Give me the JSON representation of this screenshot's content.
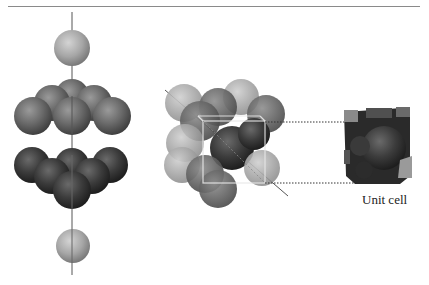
{
  "figure": {
    "caption_unit_cell": "Unit cell",
    "panels": [
      {
        "id": "layered-stack",
        "description": "ABC layer stacking: single sphere, layer of 7, layer of 7, single sphere along vertical axis"
      },
      {
        "id": "cubic-arrangement",
        "description": "Close-packed spheres viewed along body diagonal with cube outline"
      },
      {
        "id": "unit-cell",
        "description": "Face-centered cubic unit cell with sphere sections"
      }
    ],
    "colors": {
      "light_sphere": "#a8a8a8",
      "mid_sphere": "#6e6e6e",
      "dark_sphere": "#3a3a3a",
      "axis_line": "#555555",
      "rule_line": "#8a8a8a"
    }
  }
}
